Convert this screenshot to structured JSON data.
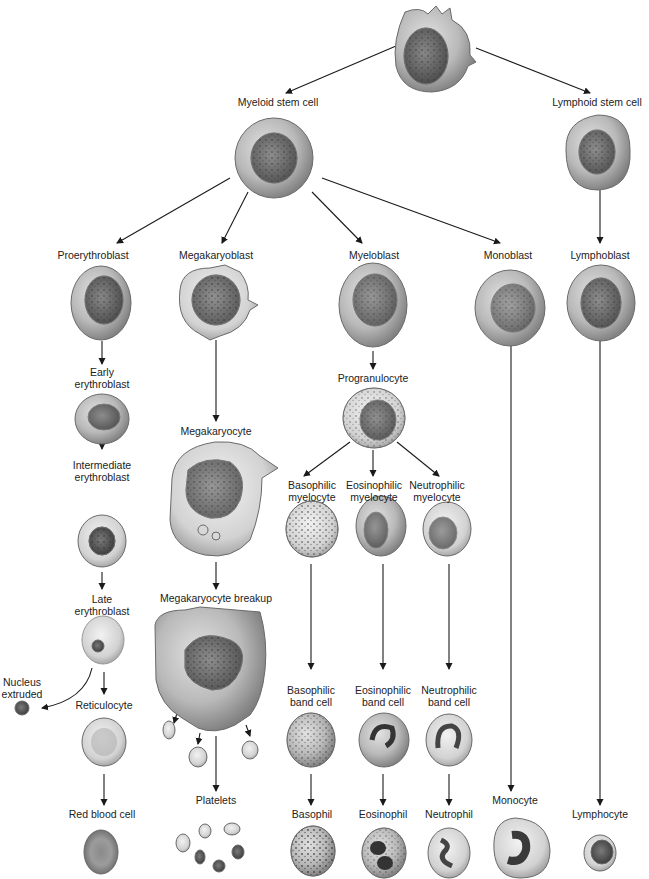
{
  "colors": {
    "background": "#ffffff",
    "cell_membrane": "#8c8c8c",
    "cell_cytoplasm": "#b8b8b8",
    "nucleus": "#4a4a4a",
    "arrow": "#1a1a1a",
    "text": "#222222"
  },
  "nodes": {
    "hsc": {
      "label": "",
      "x": 432,
      "y": 48
    },
    "myeloid": {
      "label": "Myeloid stem cell",
      "x": 278,
      "y": 102
    },
    "lymphoid": {
      "label": "Lymphoid stem cell",
      "x": 597,
      "y": 102
    },
    "proeryth": {
      "label": "Proerythroblast",
      "x": 93,
      "y": 255
    },
    "megablast": {
      "label": "Megakaryoblast",
      "x": 216,
      "y": 255
    },
    "myeloblast": {
      "label": "Myeloblast",
      "x": 374,
      "y": 255
    },
    "monoblast": {
      "label": "Monoblast",
      "x": 508,
      "y": 255
    },
    "lymphoblast": {
      "label": "Lymphoblast",
      "x": 600,
      "y": 255
    },
    "early_ery": {
      "label_line1": "Early",
      "label_line2": "erythroblast",
      "x": 102,
      "y": 372
    },
    "megacyte": {
      "label": "Megakaryocyte",
      "x": 216,
      "y": 430
    },
    "progran": {
      "label": "Progranulocyte",
      "x": 373,
      "y": 377
    },
    "intermed": {
      "label_line1": "Intermediate",
      "label_line2": "erythroblast",
      "x": 102,
      "y": 457
    },
    "baso_myel": {
      "label_line1": "Basophilic",
      "label_line2": "myelocyte",
      "x": 312,
      "y": 484
    },
    "eos_myel": {
      "label_line1": "Eosinophilic",
      "label_line2": "myelocyte",
      "x": 374,
      "y": 484
    },
    "neut_myel": {
      "label_line1": "Neutrophilic",
      "label_line2": "myelocyte",
      "x": 437,
      "y": 484
    },
    "late_ery": {
      "label_line1": "Late",
      "label_line2": "erythroblast",
      "x": 102,
      "y": 596
    },
    "mk_breakup": {
      "label": "Megakaryocyte breakup",
      "x": 216,
      "y": 596
    },
    "nucleus_ext": {
      "label_line1": "Nucleus",
      "label_line2": "extruded",
      "x": 22,
      "y": 675
    },
    "reticulo": {
      "label": "Reticulocyte",
      "x": 104,
      "y": 705
    },
    "baso_band": {
      "label_line1": "Basophilic",
      "label_line2": "band cell",
      "x": 312,
      "y": 689
    },
    "eos_band": {
      "label_line1": "Eosinophilic",
      "label_line2": "band cell",
      "x": 383,
      "y": 689
    },
    "neut_band": {
      "label_line1": "Neutrophilic",
      "label_line2": "band cell",
      "x": 449,
      "y": 689
    },
    "rbc": {
      "label": "Red blood cell",
      "x": 102,
      "y": 813
    },
    "platelets": {
      "label": "Platelets",
      "x": 216,
      "y": 799
    },
    "basophil": {
      "label": "Basophil",
      "x": 312,
      "y": 813
    },
    "eosinophil": {
      "label": "Eosinophil",
      "x": 383,
      "y": 813
    },
    "neutrophil": {
      "label": "Neutrophil",
      "x": 449,
      "y": 813
    },
    "monocyte": {
      "label": "Monocyte",
      "x": 515,
      "y": 799
    },
    "lymphocyte": {
      "label": "Lymphocyte",
      "x": 600,
      "y": 813
    }
  }
}
